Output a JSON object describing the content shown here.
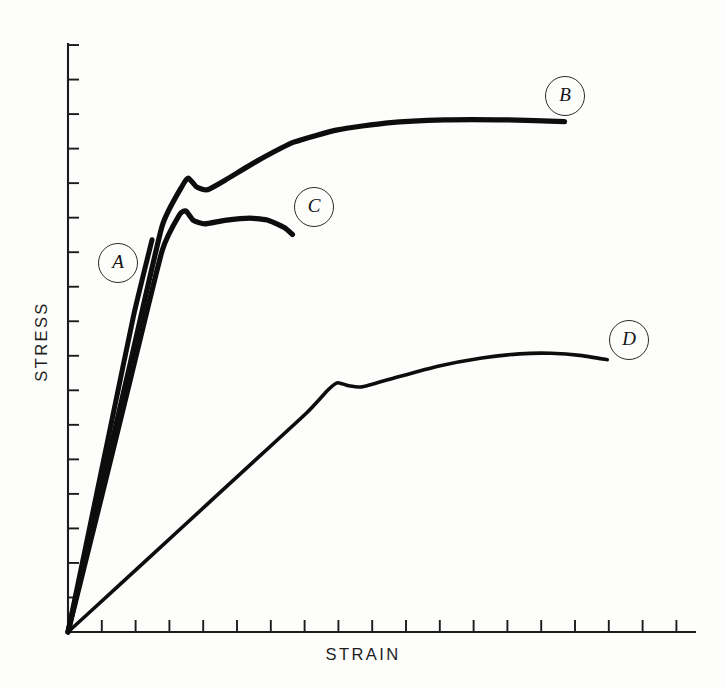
{
  "figure": {
    "background_color": "#fdfdfc",
    "ink_color": "#0d0d0d"
  },
  "axes": {
    "x_label": "STRAIN",
    "y_label": "STRESS",
    "x_tick_count": 18,
    "y_tick_count": 17,
    "origin_px": [
      68,
      632
    ],
    "x_axis_end_px": [
      695,
      632
    ],
    "y_axis_end_px": [
      68,
      44
    ]
  },
  "labels": {
    "a": "A",
    "b": "B",
    "c": "C",
    "d": "D"
  },
  "chart_data": {
    "type": "line",
    "xlabel": "STRAIN",
    "ylabel": "STRESS",
    "xlim": [
      0,
      1
    ],
    "ylim": [
      0,
      1
    ],
    "grid": false,
    "axis_ticks_unlabeled": true,
    "legend": "inline-circled-labels",
    "series": [
      {
        "name": "A",
        "label": "A",
        "description": "Steep linear elastic response ending in abrupt brittle fracture; no yielding.",
        "stroke_width": 5.0,
        "points": [
          [
            0.0,
            0.0
          ],
          [
            0.035,
            0.18
          ],
          [
            0.07,
            0.36
          ],
          [
            0.105,
            0.54
          ],
          [
            0.134,
            0.667
          ]
        ]
      },
      {
        "name": "B",
        "label": "B",
        "description": "Linear elastic region, sharp upper yield point with small drop to lower yield, then strong strain hardening rising to a high plateau; most ductile and strongest.",
        "stroke_width": 5.2,
        "points": [
          [
            0.0,
            0.0
          ],
          [
            0.05,
            0.23
          ],
          [
            0.1,
            0.46
          ],
          [
            0.15,
            0.69
          ],
          [
            0.183,
            0.76
          ],
          [
            0.192,
            0.772
          ],
          [
            0.205,
            0.757
          ],
          [
            0.222,
            0.752
          ],
          [
            0.25,
            0.768
          ],
          [
            0.3,
            0.8
          ],
          [
            0.36,
            0.833
          ],
          [
            0.43,
            0.854
          ],
          [
            0.51,
            0.866
          ],
          [
            0.6,
            0.871
          ],
          [
            0.7,
            0.871
          ],
          [
            0.792,
            0.868
          ]
        ]
      },
      {
        "name": "C",
        "label": "C",
        "description": "Same elastic modulus as B with an upper and lower yield point, but only a short flat plateau before early fracture; limited ductility.",
        "stroke_width": 5.2,
        "points": [
          [
            0.0,
            0.0
          ],
          [
            0.05,
            0.215
          ],
          [
            0.1,
            0.432
          ],
          [
            0.15,
            0.648
          ],
          [
            0.178,
            0.71
          ],
          [
            0.188,
            0.716
          ],
          [
            0.2,
            0.7
          ],
          [
            0.218,
            0.694
          ],
          [
            0.25,
            0.7
          ],
          [
            0.29,
            0.704
          ],
          [
            0.32,
            0.7
          ],
          [
            0.345,
            0.688
          ],
          [
            0.358,
            0.676
          ]
        ]
      },
      {
        "name": "D",
        "label": "D",
        "description": "Low elastic modulus, gradual yield with a slight drop, broad strain hardening to a rounded maximum, then a small decline toward fracture; weakest but ductile.",
        "stroke_width": 3.6,
        "points": [
          [
            0.0,
            0.0
          ],
          [
            0.08,
            0.078
          ],
          [
            0.18,
            0.176
          ],
          [
            0.28,
            0.274
          ],
          [
            0.38,
            0.372
          ],
          [
            0.415,
            0.412
          ],
          [
            0.43,
            0.424
          ],
          [
            0.447,
            0.419
          ],
          [
            0.47,
            0.417
          ],
          [
            0.52,
            0.432
          ],
          [
            0.59,
            0.452
          ],
          [
            0.66,
            0.466
          ],
          [
            0.72,
            0.473
          ],
          [
            0.77,
            0.474
          ],
          [
            0.82,
            0.47
          ],
          [
            0.86,
            0.463
          ]
        ]
      }
    ],
    "annotations": [
      {
        "text": "A",
        "series": "A",
        "x_px": 118,
        "y_px": 263
      },
      {
        "text": "B",
        "series": "B",
        "x_px": 565,
        "y_px": 96
      },
      {
        "text": "C",
        "series": "C",
        "x_px": 314,
        "y_px": 207
      },
      {
        "text": "D",
        "series": "D",
        "x_px": 629,
        "y_px": 340
      }
    ]
  }
}
